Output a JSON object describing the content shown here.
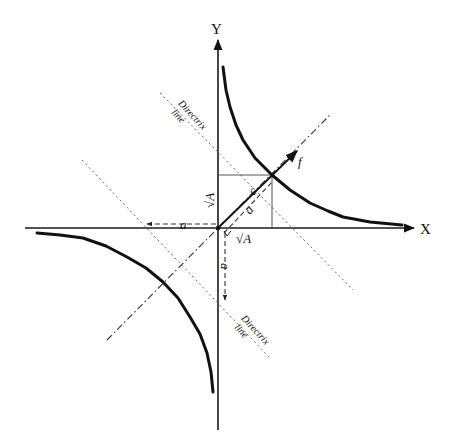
{
  "figure": {
    "type": "rectangular-hyperbola-diagram",
    "axes": {
      "x_label": "X",
      "y_label": "Y"
    },
    "labels": {
      "directrix_upper_word": "Directrix",
      "directrix_upper_line": "line",
      "directrix_lower_word": "Directrix",
      "directrix_lower_line": "line",
      "focus": "f",
      "focal_distance": "c",
      "semi_axis": "a",
      "sqrtA_vertical": "√A",
      "sqrtA_horizontal": "√A",
      "a_left": "a",
      "a_down": "a"
    },
    "colors": {
      "background": "#ffffff",
      "stroke": "#111111",
      "guide": "#666666"
    }
  }
}
